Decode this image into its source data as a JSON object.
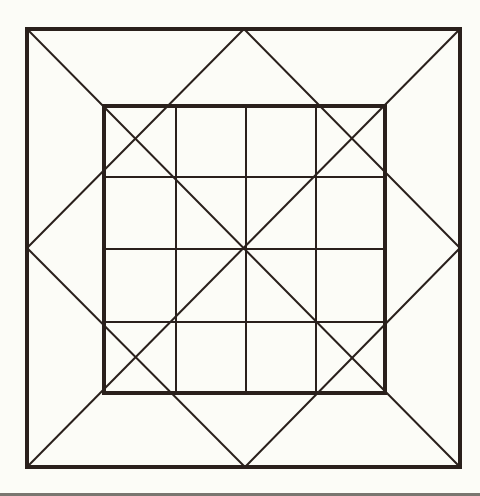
{
  "diagram": {
    "colors": {
      "background": "#fcfcf7",
      "stroke": "#2a201c",
      "bottom_band": "#7a7670"
    },
    "outer_square": {
      "x1": 27,
      "y1": 29,
      "x2": 460,
      "y2": 467,
      "stroke_width": 4
    },
    "inner_square": {
      "x1": 104,
      "y1": 106,
      "x2": 385,
      "y2": 393,
      "stroke_width": 4
    },
    "grid": {
      "vertical_lines_x": [
        176,
        246,
        316
      ],
      "horizontal_lines_y": [
        177,
        249,
        322
      ],
      "stroke_width": 2
    },
    "center": {
      "x": 245,
      "y": 248
    },
    "outer_midpoints": {
      "top": {
        "x": 244,
        "y": 29
      },
      "right": {
        "x": 460,
        "y": 248
      },
      "bottom": {
        "x": 245,
        "y": 467
      },
      "left": {
        "x": 27,
        "y": 248
      }
    },
    "diagonal_stroke_width": 2
  }
}
